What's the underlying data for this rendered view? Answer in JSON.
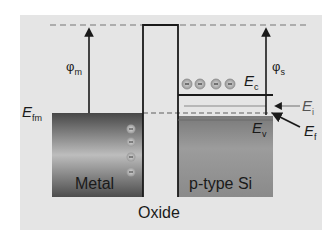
{
  "diagram": {
    "type": "band-diagram",
    "title": "",
    "regions": [
      {
        "name": "Metal",
        "label": "Metal"
      },
      {
        "name": "Oxide",
        "label": "Oxide"
      },
      {
        "name": "Semiconductor",
        "label": "p-type Si"
      }
    ],
    "labels": {
      "phi_m": {
        "symbol": "φ",
        "sub": "m"
      },
      "phi_s": {
        "symbol": "φ",
        "sub": "s"
      },
      "E_fm": {
        "symbol": "E",
        "sub": "fm"
      },
      "E_c": {
        "symbol": "E",
        "sub": "c"
      },
      "E_i": {
        "symbol": "E",
        "sub": "i"
      },
      "E_f": {
        "symbol": "E",
        "sub": "f"
      },
      "E_v": {
        "symbol": "E",
        "sub": "v"
      }
    },
    "charges": {
      "metal_electrons": 4,
      "semiconductor_electrons": 4,
      "glyph": "−"
    },
    "colors": {
      "background": "#e5e5e5",
      "line": "#1a1a1a",
      "dashed": "#9a9a9a",
      "metal_dark": "#4a4a4a",
      "metal_light": "#b5b5b5",
      "semiconductor": "#8f8f8f"
    }
  }
}
